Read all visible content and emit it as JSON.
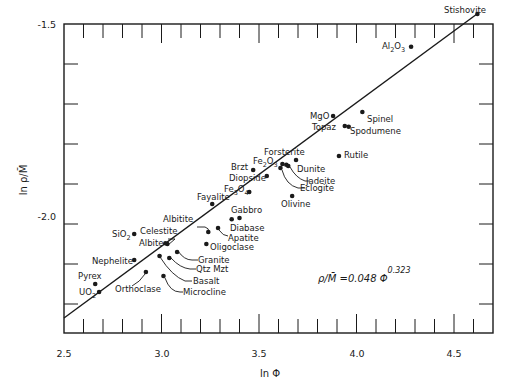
{
  "chart_data": {
    "type": "scatter",
    "title": "",
    "xlabel": "ln Φ",
    "ylabel": "ln ρ/M̄",
    "xlim": [
      2.5,
      4.7
    ],
    "ylim": [
      -2.27,
      -1.5
    ],
    "x_ticks": [
      2.5,
      3.0,
      3.5,
      4.0,
      4.5
    ],
    "y_ticks": [
      -1.5,
      -2.0
    ],
    "x_minor_step": 0.1,
    "y_minor_step": 0.1,
    "grid": false,
    "legend": null,
    "annotation": {
      "text": "ρ/M̄ = 0.048 Φ",
      "exponent": "0.323"
    },
    "fit_line": {
      "label": "ρ/M̄ = 0.048 Φ^0.323",
      "slope": 0.323,
      "intercept": -3.036,
      "x_range": [
        2.5,
        4.62
      ]
    },
    "points": [
      {
        "name": "Stishovite",
        "x": 4.62,
        "y": -1.475
      },
      {
        "name": "Al2O3",
        "x": 4.28,
        "y": -1.557
      },
      {
        "name": "MgO",
        "x": 3.88,
        "y": -1.73
      },
      {
        "name": "Spinel",
        "x": 4.03,
        "y": -1.72
      },
      {
        "name": "Topaz",
        "x": 3.94,
        "y": -1.755
      },
      {
        "name": "Spodumene",
        "x": 3.96,
        "y": -1.757
      },
      {
        "name": "Rutile",
        "x": 3.91,
        "y": -1.83
      },
      {
        "name": "Forsterite",
        "x": 3.69,
        "y": -1.84
      },
      {
        "name": "Fe2O3",
        "x": 3.62,
        "y": -1.85
      },
      {
        "name": "Dunite",
        "x": 3.64,
        "y": -1.852
      },
      {
        "name": "Jadeite",
        "x": 3.65,
        "y": -1.855
      },
      {
        "name": "Eclogite",
        "x": 3.61,
        "y": -1.86
      },
      {
        "name": "Olivine",
        "x": 3.67,
        "y": -1.93
      },
      {
        "name": "Brzt",
        "x": 3.47,
        "y": -1.865
      },
      {
        "name": "Diopside",
        "x": 3.54,
        "y": -1.88
      },
      {
        "name": "Fe3O4",
        "x": 3.45,
        "y": -1.92
      },
      {
        "name": "Fayalite",
        "x": 3.26,
        "y": -1.95
      },
      {
        "name": "Gabbro",
        "x": 3.4,
        "y": -1.985
      },
      {
        "name": "Diabase",
        "x": 3.36,
        "y": -1.988
      },
      {
        "name": "Albitite",
        "x": 3.24,
        "y": -2.02
      },
      {
        "name": "Apatite",
        "x": 3.29,
        "y": -2.01
      },
      {
        "name": "Oligoclase",
        "x": 3.23,
        "y": -2.05
      },
      {
        "name": "Celestite",
        "x": 3.03,
        "y": -2.05
      },
      {
        "name": "Albite",
        "x": 3.02,
        "y": -2.048
      },
      {
        "name": "SiO2",
        "x": 2.86,
        "y": -2.025
      },
      {
        "name": "Granite",
        "x": 3.08,
        "y": -2.07
      },
      {
        "name": "Qtz Mzt",
        "x": 3.04,
        "y": -2.085
      },
      {
        "name": "Basalt",
        "x": 2.99,
        "y": -2.08
      },
      {
        "name": "Microcline",
        "x": 3.01,
        "y": -2.13
      },
      {
        "name": "Orthoclase",
        "x": 2.92,
        "y": -2.12
      },
      {
        "name": "Nephelite",
        "x": 2.86,
        "y": -2.09
      },
      {
        "name": "Pyrex",
        "x": 2.66,
        "y": -2.15
      },
      {
        "name": "UO2",
        "x": 2.68,
        "y": -2.17
      }
    ]
  },
  "labels": {
    "x_axis": "ln Φ",
    "y_axis": "ln ρ/M̄",
    "x_tick_labels": [
      "2.5",
      "3.0",
      "3.5",
      "4.0",
      "4.5"
    ],
    "y_tick_labels": [
      "-1.5",
      "-2.0"
    ],
    "equation": "ρ/M̄ =0.048 Φ",
    "equation_exp": "0.323"
  },
  "colors": {
    "ink": "#1a1a1a",
    "background": "#ffffff"
  }
}
